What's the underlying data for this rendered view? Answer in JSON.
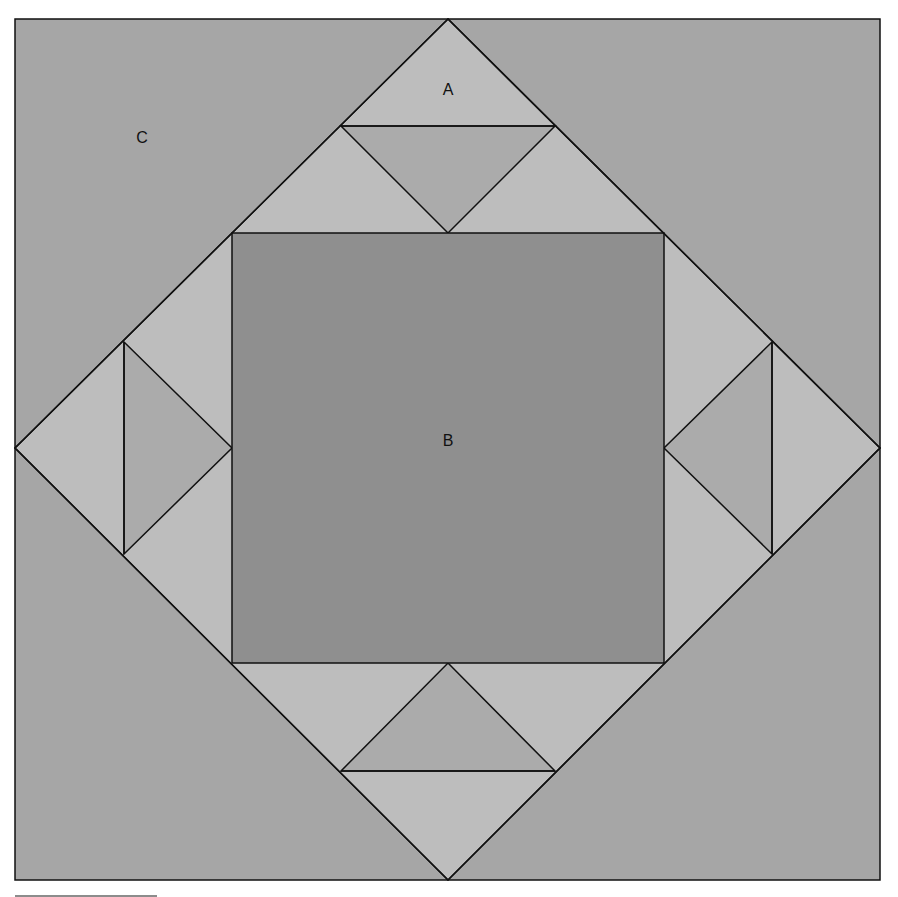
{
  "diagram": {
    "labels": {
      "a": "A",
      "b": "B",
      "c": "C"
    },
    "colors": {
      "background": "#a6a6a6",
      "light_triangles": "#bdbdbd",
      "medium_triangles": "#ababab",
      "center_square": "#8f8f8f",
      "stroke": "#111111"
    }
  }
}
